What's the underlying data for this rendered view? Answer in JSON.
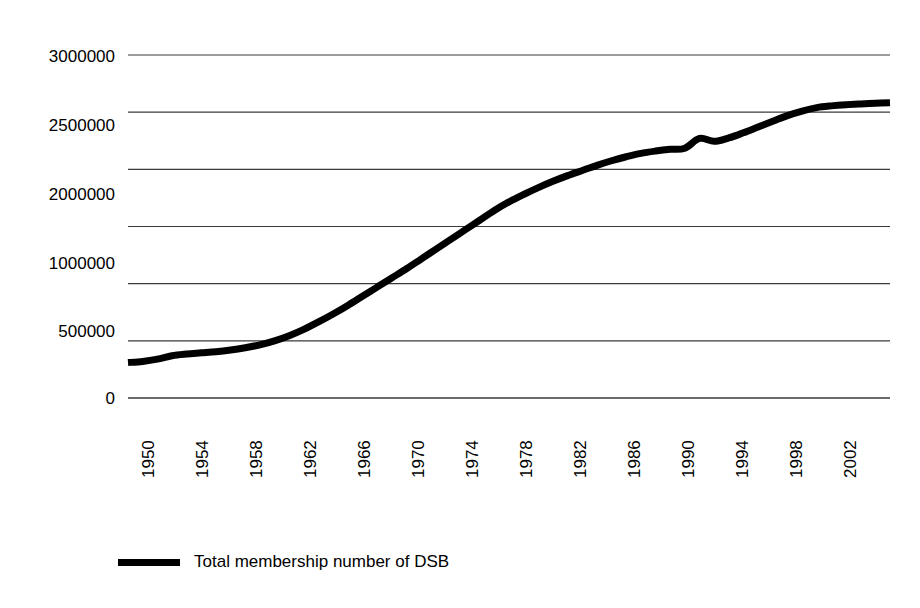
{
  "chart_data": {
    "type": "line",
    "title": "",
    "subtitle": "",
    "xlabel": "",
    "ylabel": "",
    "grid": true,
    "legend_position": "bottom-left",
    "xlim": [
      1950,
      2002
    ],
    "ylim": [
      0,
      3000000
    ],
    "y_ticks": [
      0,
      500000,
      1000000,
      1500000,
      2000000,
      2500000,
      3000000
    ],
    "y_tick_labels": [
      "0",
      "500000",
      "1000000",
      "",
      "2000000",
      "2500000",
      "3000000"
    ],
    "x_tick_labels": [
      "1950",
      "1954",
      "1958",
      "1962",
      "1966",
      "1970",
      "1974",
      "1978",
      "1982",
      "1986",
      "1990",
      "1994",
      "1998",
      "2002"
    ],
    "series": [
      {
        "name": "Total membership number of DSB",
        "color": "#000000",
        "line_width": 7,
        "x": [
          1950,
          1951,
          1952,
          1953,
          1954,
          1955,
          1956,
          1957,
          1958,
          1959,
          1960,
          1961,
          1962,
          1963,
          1964,
          1965,
          1966,
          1967,
          1968,
          1969,
          1970,
          1971,
          1972,
          1973,
          1974,
          1975,
          1976,
          1977,
          1978,
          1979,
          1980,
          1981,
          1982,
          1983,
          1984,
          1985,
          1986,
          1987,
          1988,
          1989,
          1990,
          1991,
          1992,
          1993,
          1994,
          1995,
          1996,
          1997,
          1998,
          1999,
          2000,
          2001,
          2002
        ],
        "values": [
          310000,
          320000,
          340000,
          370000,
          385000,
          395000,
          405000,
          420000,
          440000,
          465000,
          500000,
          545000,
          600000,
          665000,
          735000,
          810000,
          890000,
          970000,
          1050000,
          1130000,
          1215000,
          1300000,
          1385000,
          1470000,
          1555000,
          1640000,
          1715000,
          1780000,
          1840000,
          1895000,
          1945000,
          1990000,
          2035000,
          2075000,
          2110000,
          2140000,
          2160000,
          2175000,
          2185000,
          2270000,
          2245000,
          2275000,
          2320000,
          2370000,
          2420000,
          2470000,
          2510000,
          2540000,
          2555000,
          2565000,
          2572000,
          2578000,
          2582000
        ]
      }
    ]
  },
  "legend": {
    "label": "Total membership number of DSB",
    "swatch": "line-swatch"
  },
  "axes": {
    "y_labels": [
      "3000000",
      "2500000",
      "2000000",
      "1000000",
      "500000",
      "0"
    ],
    "x_labels": [
      "1950",
      "1954",
      "1958",
      "1962",
      "1966",
      "1970",
      "1974",
      "1978",
      "1982",
      "1986",
      "1990",
      "1994",
      "1998",
      "2002"
    ]
  }
}
